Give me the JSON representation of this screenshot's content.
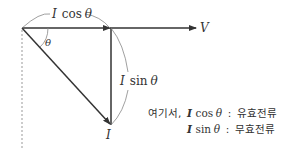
{
  "diagram": {
    "labels": {
      "cos_label_i": "I",
      "cos_label_rest": "cos",
      "cos_label_theta": "θ",
      "sin_label_i": "I",
      "sin_label_rest": "sin",
      "sin_label_theta": "θ",
      "voltage": "V",
      "current": "I",
      "angle": "θ"
    },
    "legend": {
      "line1_prefix": "여기서,",
      "line1_i": "I",
      "line1_func": "cos",
      "line1_theta": "θ",
      "line1_sep": ":",
      "line1_desc": "유효전류",
      "line2_i": "I",
      "line2_func": "sin",
      "line2_theta": "θ",
      "line2_sep": ":",
      "line2_desc": "무효전류"
    },
    "colors": {
      "line": "#333333",
      "thin_arc": "#888888",
      "dashed": "#999999"
    }
  }
}
